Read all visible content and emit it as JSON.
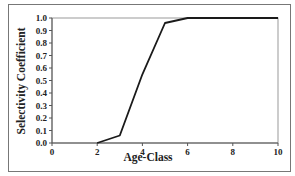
{
  "chart_data": {
    "type": "line",
    "title": "",
    "xlabel": "Age-Class",
    "ylabel": "Selectivity Coefficient",
    "x": [
      2,
      3,
      4,
      5,
      6,
      10
    ],
    "series": [
      {
        "name": "Selectivity",
        "values": [
          0.0,
          0.06,
          0.55,
          0.96,
          1.0,
          1.0
        ]
      }
    ],
    "xlim": [
      0,
      10
    ],
    "ylim": [
      0.0,
      1.0
    ],
    "xticks": [
      "0",
      "2",
      "4",
      "6",
      "8",
      "10"
    ],
    "yticks": [
      "0.0",
      "0.1",
      "0.2",
      "0.3",
      "0.4",
      "0.5",
      "0.6",
      "0.7",
      "0.8",
      "0.9",
      "1.0"
    ],
    "grid": false,
    "legend": "none",
    "line_color": "#1a1a1a"
  }
}
